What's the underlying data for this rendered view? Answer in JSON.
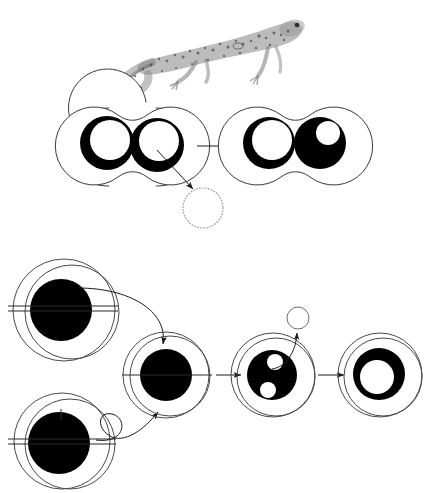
{
  "figure": {
    "background_color": "#ffffff",
    "ink_color": "#000000",
    "outline_color": "#3a3a3a",
    "faint_color": "#9a9a9a",
    "width": 431,
    "height": 493
  },
  "specimen": {
    "name": "newt-illustration",
    "caption": "",
    "description": "stippled engraving of a newt facing right",
    "x": 120,
    "y": 8,
    "width": 185,
    "height": 84
  },
  "top_sequence": {
    "name": "binucleate-extrusion-sequence",
    "stages": [
      {
        "id": "stage-a",
        "label": "",
        "cell_shape": "figure-eight",
        "cx": 130,
        "cy": 145,
        "nuclei": [
          {
            "type": "crescent-ring",
            "cx": 107,
            "cy": 143,
            "r": 27,
            "inner_r": 20,
            "offset_x": 3,
            "offset_y": -3
          },
          {
            "type": "crescent-ring",
            "cx": 157,
            "cy": 145,
            "r": 27,
            "inner_r": 20,
            "offset_x": 2,
            "offset_y": -4
          }
        ]
      },
      {
        "id": "stage-b",
        "label": "",
        "cell_shape": "figure-eight",
        "cx": 293,
        "cy": 145,
        "nuclei": [
          {
            "type": "crescent-ring",
            "cx": 269,
            "cy": 143,
            "r": 26,
            "inner_r": 20,
            "offset_x": 3,
            "offset_y": -3
          },
          {
            "type": "solid-with-vacuole",
            "cx": 320,
            "cy": 143,
            "r": 26,
            "inner_r": 12,
            "offset_x": 8,
            "offset_y": -10
          }
        ]
      }
    ],
    "extruded_body": {
      "name": "extruded-chromatin-body",
      "style": "dotted",
      "cx": 203,
      "cy": 208,
      "r": 20
    },
    "arrows": [
      {
        "name": "arrow-stage-a-to-b",
        "type": "straight",
        "x1": 196,
        "y1": 146,
        "x2": 240,
        "y2": 146
      },
      {
        "name": "arrow-extrusion",
        "type": "straight",
        "x1": 157,
        "y1": 150,
        "x2": 196,
        "y2": 192
      }
    ]
  },
  "bottom_sequence": {
    "name": "fusion-and-reorganisation-sequence",
    "stages": [
      {
        "id": "stage-1-upper",
        "label": "",
        "cell_shape": "circle",
        "cx": 64,
        "cy": 310,
        "r": 51,
        "nucleus": {
          "type": "solid",
          "cx": 61,
          "cy": 310,
          "r": 31
        },
        "spindle": true
      },
      {
        "id": "stage-1-lower",
        "label": "",
        "cell_shape": "circle",
        "cx": 62,
        "cy": 441,
        "r": 48,
        "nucleus": {
          "type": "solid",
          "cx": 59,
          "cy": 443,
          "r": 31
        },
        "spindle": true
      },
      {
        "id": "stage-2-fused",
        "label": "",
        "cell_shape": "circle",
        "cx": 166,
        "cy": 375,
        "r": 43,
        "nucleus": {
          "type": "solid",
          "cx": 166,
          "cy": 375,
          "r": 26
        },
        "spindle": true
      },
      {
        "id": "stage-3-vacuolate",
        "label": "",
        "cell_shape": "circle",
        "cx": 273,
        "cy": 375,
        "r": 42,
        "nucleus": {
          "type": "solid-with-two-vacuoles",
          "cx": 272,
          "cy": 375,
          "r": 25
        },
        "vacuoles": [
          {
            "cx": 275,
            "cy": 362,
            "r": 8
          },
          {
            "cx": 268,
            "cy": 390,
            "r": 8
          }
        ]
      },
      {
        "id": "stage-4-annulus",
        "label": "",
        "cell_shape": "circle",
        "cx": 380,
        "cy": 375,
        "r": 42,
        "nucleus": {
          "type": "thick-ring",
          "cx": 379,
          "cy": 374,
          "r": 26,
          "inner_r": 17,
          "offset_x": -2,
          "offset_y": 3
        }
      }
    ],
    "expelled_body": {
      "name": "expelled-vesicle",
      "style": "thin-outline",
      "cx": 298,
      "cy": 318,
      "r": 11
    },
    "arrows": [
      {
        "name": "arrow-upper-cell-to-fused",
        "type": "curved"
      },
      {
        "name": "arrow-lower-cell-to-fused",
        "type": "looped"
      },
      {
        "name": "arrow-fused-to-vacuolate",
        "type": "straight",
        "x1": 216,
        "y1": 375,
        "x2": 243,
        "y2": 375
      },
      {
        "name": "arrow-vacuolate-to-annulus",
        "type": "straight",
        "x1": 318,
        "y1": 375,
        "x2": 345,
        "y2": 375
      },
      {
        "name": "arrow-vesicle-expulsion",
        "type": "curved"
      }
    ]
  }
}
